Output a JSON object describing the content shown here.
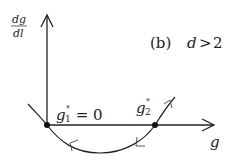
{
  "diagram": {
    "panel_label": "(b)",
    "condition": "d > 2",
    "condition_parts": {
      "var": "d",
      "op": ">",
      "val": "2"
    },
    "y_axis_label": {
      "numerator": "dg",
      "denominator": "dl"
    },
    "x_axis_label": "g",
    "fixed_points": [
      {
        "label": "g",
        "sub": "1",
        "sup": "*",
        "value_text": " = 0",
        "stability": "stable"
      },
      {
        "label": "g",
        "sub": "2",
        "sup": "*",
        "value_text": "",
        "stability": "unstable"
      }
    ],
    "flow_arrows": [
      {
        "position": "left-of-minimum",
        "direction": "toward g1*"
      },
      {
        "position": "right-of-minimum",
        "direction": "toward g1*"
      },
      {
        "position": "beyond g2*",
        "direction": "away from g2*"
      }
    ],
    "colors": {
      "ink": "#222222",
      "background": "#ffffff"
    }
  }
}
